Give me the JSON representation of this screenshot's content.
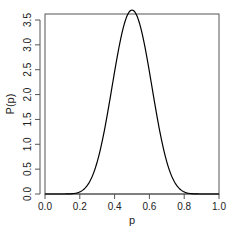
{
  "chart_data": {
    "type": "line",
    "title": "",
    "xlabel": "p",
    "ylabel": "P(p)",
    "xlim": [
      0.0,
      1.0
    ],
    "ylim": [
      0.0,
      3.5
    ],
    "xticks": [
      "0.0",
      "0.2",
      "0.4",
      "0.6",
      "0.8",
      "1.0"
    ],
    "yticks": [
      "0.0",
      "0.5",
      "1.0",
      "1.5",
      "2.0",
      "2.5",
      "3.0",
      "3.5"
    ],
    "grid": false,
    "legend": null,
    "series": [
      {
        "name": "density",
        "color": "#000000",
        "x": [
          0.0,
          0.05,
          0.1,
          0.15,
          0.2,
          0.25,
          0.3,
          0.35,
          0.4,
          0.45,
          0.5,
          0.55,
          0.6,
          0.65,
          0.7,
          0.75,
          0.8,
          0.85,
          0.9,
          0.95,
          1.0
        ],
        "y": [
          0.0,
          0.0,
          0.0,
          0.02,
          0.12,
          0.42,
          1.03,
          1.9,
          2.77,
          3.35,
          3.52,
          3.35,
          2.77,
          1.9,
          1.03,
          0.42,
          0.12,
          0.02,
          0.0,
          0.0,
          0.0
        ]
      }
    ]
  }
}
